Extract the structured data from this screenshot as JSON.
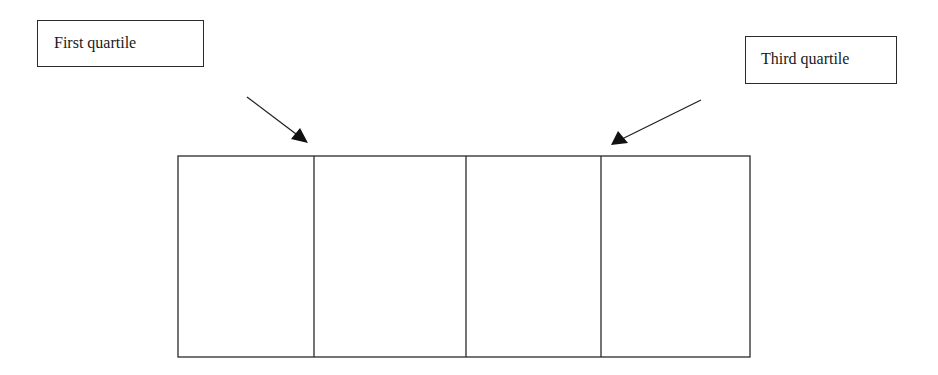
{
  "labels": {
    "first_quartile": "First quartile",
    "third_quartile": "Third quartile"
  },
  "diagram": {
    "type": "box-divided-into-quartiles",
    "sections": 4,
    "callouts": [
      {
        "label": "First quartile",
        "points_to": "boundary between section 1 and 2"
      },
      {
        "label": "Third quartile",
        "points_to": "boundary between section 3 and 4"
      }
    ]
  },
  "colors": {
    "stroke": "#2a2a2a",
    "background": "#ffffff"
  }
}
